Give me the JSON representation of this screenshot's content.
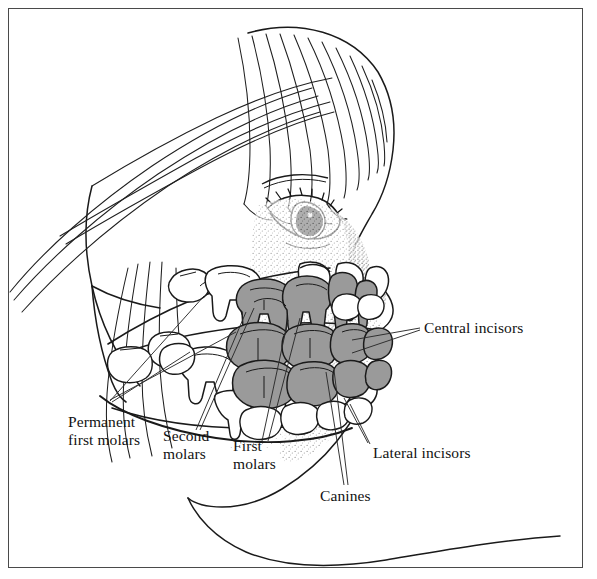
{
  "figure": {
    "border_color": "#4a4a4a",
    "background": "#ffffff",
    "ink_color": "#1a1a1a",
    "deciduous_tooth_fill": "#9a9a9a",
    "permanent_tooth_fill": "#ffffff",
    "stipple_color": "#5d5d5d"
  },
  "labels": {
    "central_incisors": "Central incisors",
    "lateral_incisors": "Lateral incisors",
    "canines": "Canines",
    "first_molars_line1": "First",
    "first_molars_line2": "molars",
    "second_molars_line1": "Second",
    "second_molars_line2": "molars",
    "permanent_first_molars_line1": "Permanent",
    "permanent_first_molars_line2": "first molars"
  },
  "anatomy": {
    "head": "child head in left profile",
    "hair": "fringe / bangs sweeping forward",
    "eye": "eye with lashes and iris",
    "nose": "nose with nostril",
    "lips": "upper and lower lip",
    "chin": "chin and neck outline",
    "mandible": "mandible outline",
    "maxilla": "maxilla outline"
  }
}
